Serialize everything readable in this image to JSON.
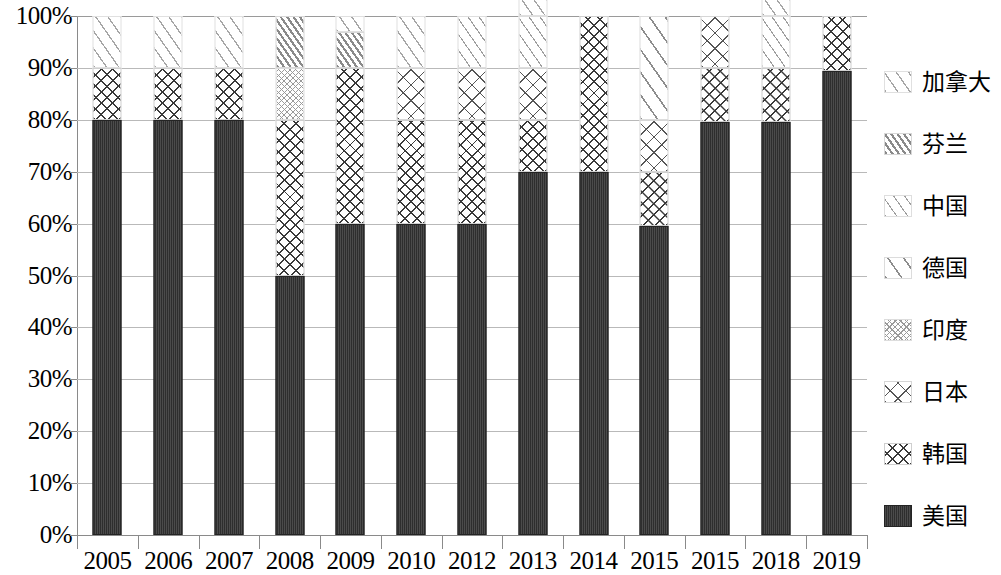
{
  "chart_data": {
    "type": "bar",
    "subtype": "stacked-percentage",
    "title": "",
    "xlabel": "",
    "ylabel": "",
    "ylim": [
      0,
      100
    ],
    "y_unit": "%",
    "grid": true,
    "legend_position": "right",
    "categories": [
      "2005",
      "2006",
      "2007",
      "2008",
      "2009",
      "2010",
      "2012",
      "2013",
      "2014",
      "2015",
      "2015",
      "2018",
      "2019"
    ],
    "y_ticks": [
      "0%",
      "10%",
      "20%",
      "30%",
      "40%",
      "50%",
      "60%",
      "70%",
      "80%",
      "90%",
      "100%"
    ],
    "y_tick_values": [
      0,
      10,
      20,
      30,
      40,
      50,
      60,
      70,
      80,
      90,
      100
    ],
    "series": [
      {
        "name": "美国",
        "key": "usa",
        "pattern": "solid-dark",
        "color": "#2e2e2e",
        "values": [
          80,
          80,
          80,
          50,
          60,
          60,
          60,
          70,
          70,
          59.5,
          79.5,
          79.5,
          89.5
        ]
      },
      {
        "name": "韩国",
        "key": "korea",
        "pattern": "dense-crosshatch",
        "color": "#3a3a3a",
        "values": [
          10,
          10,
          10,
          30,
          30,
          20,
          20,
          10,
          30,
          10.5,
          10.5,
          10.5,
          10.5
        ]
      },
      {
        "name": "日本",
        "key": "japan",
        "pattern": "open-crosshatch",
        "color": "#555555",
        "values": [
          0,
          0,
          0,
          0,
          0,
          10,
          10,
          10,
          0,
          10,
          10,
          0,
          0
        ]
      },
      {
        "name": "印度",
        "key": "india",
        "pattern": "fine-dotted-crosshatch",
        "color": "#9a9a9a",
        "values": [
          0,
          0,
          0,
          10,
          0,
          0,
          0,
          0,
          0,
          0,
          0,
          0,
          0
        ]
      },
      {
        "name": "德国",
        "key": "germany",
        "pattern": "wide-diagonal",
        "color": "#8d8d8d",
        "values": [
          0,
          0,
          0,
          0,
          0,
          0,
          0,
          0,
          0,
          20,
          0,
          0,
          0
        ]
      },
      {
        "name": "中国",
        "key": "china",
        "pattern": "sparse-thin-diagonal",
        "color": "#9e9e9e",
        "values": [
          0,
          0,
          0,
          0,
          0,
          0,
          10,
          10,
          0,
          0,
          0,
          10,
          0
        ]
      },
      {
        "name": "芬兰",
        "key": "finland",
        "pattern": "dense-diagonal",
        "color": "#8a8a8a",
        "values": [
          0,
          0,
          0,
          10,
          7,
          0,
          0,
          0,
          0,
          0,
          0,
          0,
          0
        ]
      },
      {
        "name": "加拿大",
        "key": "canada",
        "pattern": "sparse-diagonal",
        "color": "#a6a6a6",
        "values": [
          10,
          10,
          10,
          0,
          3,
          10,
          0,
          10,
          0,
          0,
          0,
          10,
          0
        ]
      }
    ]
  },
  "legend": {
    "items": [
      {
        "label": "加拿大",
        "key": "canada"
      },
      {
        "label": "芬兰",
        "key": "finland"
      },
      {
        "label": "中国",
        "key": "china"
      },
      {
        "label": "德国",
        "key": "germany"
      },
      {
        "label": "印度",
        "key": "india"
      },
      {
        "label": "日本",
        "key": "japan"
      },
      {
        "label": "韩国",
        "key": "korea"
      },
      {
        "label": "美国",
        "key": "usa"
      }
    ]
  }
}
